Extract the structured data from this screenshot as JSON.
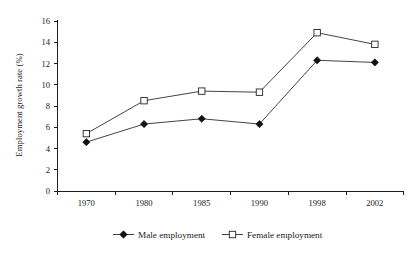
{
  "chart_data": {
    "type": "line",
    "title": "",
    "subtitle": "",
    "xlabel": "",
    "ylabel": "Employment growth rate (%)",
    "categories": [
      "1970",
      "1980",
      "1985",
      "1990",
      "1998",
      "2002"
    ],
    "x": [
      1970,
      1980,
      1985,
      1990,
      1998,
      2002
    ],
    "series": [
      {
        "name": "Male employment",
        "marker": "filled-diamond",
        "values": [
          4.6,
          6.3,
          6.8,
          6.3,
          12.3,
          12.1
        ]
      },
      {
        "name": "Female employment",
        "marker": "open-square",
        "values": [
          5.4,
          8.5,
          9.4,
          9.3,
          14.9,
          13.8
        ]
      }
    ],
    "ylim": [
      0,
      16
    ],
    "yticks": [
      0,
      2,
      4,
      6,
      8,
      10,
      12,
      14,
      16
    ],
    "ytick_labels": [
      "0",
      "2",
      "4",
      "6",
      "8",
      "10",
      "12",
      "14",
      "16"
    ],
    "xtick_labels": [
      "1970",
      "1980",
      "1985",
      "1990",
      "1998",
      "2002"
    ],
    "grid": false,
    "legend_position": "bottom",
    "legend_entries": [
      "Male employment",
      "Female employment"
    ],
    "colors": {
      "line": "#3a3a3a",
      "male_marker_fill": "#111111",
      "female_marker_fill": "#ffffff",
      "marker_stroke": "#232323",
      "axis": "#1c1c1c",
      "background": "#ffffff",
      "text": "#1a1a1a"
    }
  },
  "legend": {
    "male_label": "Male employment",
    "female_label": "Female employment"
  },
  "axes": {
    "y_title": "Employment growth rate (%)"
  }
}
